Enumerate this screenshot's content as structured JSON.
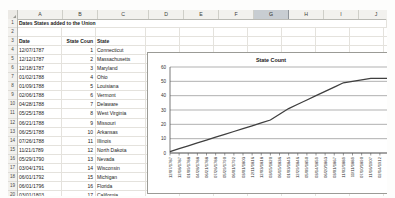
{
  "app": {
    "type": "spreadsheet"
  },
  "grid": {
    "columns": [
      "A",
      "B",
      "C",
      "D",
      "E",
      "F",
      "G",
      "H",
      "I",
      "J",
      "K",
      "L"
    ],
    "selected_column": "G",
    "rows": [
      1,
      2,
      3,
      4,
      5,
      6,
      7,
      8,
      9,
      10,
      11,
      12,
      13,
      14,
      15,
      16,
      17,
      18,
      19,
      20,
      21
    ]
  },
  "sheet": {
    "title": "Dates States added to the Union",
    "headers": {
      "a": "Date",
      "b": "State Coun",
      "c": "State"
    },
    "records": [
      {
        "row": 4,
        "date": "12/07/1787",
        "count": "1",
        "state": "Connecticut"
      },
      {
        "row": 5,
        "date": "12/12/1787",
        "count": "2",
        "state": "Massachusetts"
      },
      {
        "row": 6,
        "date": "12/18/1787",
        "count": "3",
        "state": "Maryland"
      },
      {
        "row": 7,
        "date": "01/02/1788",
        "count": "4",
        "state": "Ohio"
      },
      {
        "row": 8,
        "date": "01/09/1788",
        "count": "5",
        "state": "Louisiana"
      },
      {
        "row": 9,
        "date": "02/06/1788",
        "count": "6",
        "state": "Vermont"
      },
      {
        "row": 10,
        "date": "04/28/1788",
        "count": "7",
        "state": "Delaware"
      },
      {
        "row": 11,
        "date": "05/25/1788",
        "count": "8",
        "state": "West Virginia"
      },
      {
        "row": 12,
        "date": "06/21/1788",
        "count": "9",
        "state": "Missouri"
      },
      {
        "row": 13,
        "date": "06/25/1788",
        "count": "10",
        "state": "Arkansas"
      },
      {
        "row": 14,
        "date": "07/26/1788",
        "count": "11",
        "state": "Illinois"
      },
      {
        "row": 15,
        "date": "11/21/1789",
        "count": "12",
        "state": "North Dakota"
      },
      {
        "row": 16,
        "date": "05/29/1790",
        "count": "13",
        "state": "Nevada"
      },
      {
        "row": 17,
        "date": "03/04/1791",
        "count": "14",
        "state": "Wisconsin"
      },
      {
        "row": 18,
        "date": "06/01/1792",
        "count": "15",
        "state": "Michigan"
      },
      {
        "row": 19,
        "date": "06/01/1796",
        "count": "16",
        "state": "Florida"
      },
      {
        "row": 20,
        "date": "03/01/1803",
        "count": "17",
        "state": "California"
      },
      {
        "row": 21,
        "date": "04/30/1812",
        "count": "18",
        "state": "Pennsylvania"
      }
    ]
  },
  "chart_data": {
    "type": "line",
    "title": "State Count",
    "xlabel": "",
    "ylabel": "",
    "ylim": [
      0,
      60
    ],
    "yticks": [
      0,
      10,
      20,
      30,
      40,
      50,
      60
    ],
    "grid": true,
    "legend": "none",
    "categories": [
      "12/07/1787",
      "12/18/1787",
      "01/09/1788",
      "04/28/1788",
      "06/21/1788",
      "07/26/1788",
      "05/29/1790",
      "06/01/1792",
      "03/01/1803",
      "12/11/1816",
      "12/03/1818",
      "03/15/1820",
      "06/15/1836",
      "01/03/1845",
      "12/29/1846",
      "05/09/1850",
      "03/14/1859",
      "06/20/1863",
      "03/01/1867",
      "11/02/1889",
      "11/11/1889",
      "07/10/1890",
      "11/16/1907",
      "02/14/1912",
      "01/06/1959"
    ],
    "values": [
      1,
      3,
      5,
      7,
      9,
      11,
      13,
      15,
      17,
      19,
      21,
      23,
      27,
      31,
      34,
      37,
      40,
      43,
      46,
      49,
      50,
      51,
      52,
      52,
      52
    ]
  }
}
